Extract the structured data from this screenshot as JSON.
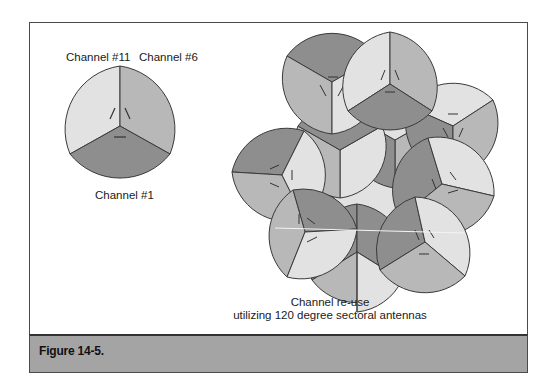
{
  "figure": {
    "caption": "Figure 14-5.",
    "colors": {
      "sector_light": "#e2e2e2",
      "sector_medium": "#b8b8b8",
      "sector_dark": "#8e8e8e",
      "outline": "#3a3a3a",
      "caption_band": "#a4a4a4"
    }
  },
  "single_cell": {
    "labels": {
      "top_left": "Channel #11",
      "top_right": "Channel #6",
      "bottom": "Channel #1"
    }
  },
  "cluster": {
    "caption_line1": "Channel re-use",
    "caption_line2": "utilizing 120 degree sectoral antennas",
    "antenna_type_degrees": 120,
    "channels": [
      "Channel #1",
      "Channel #6",
      "Channel #11"
    ]
  }
}
